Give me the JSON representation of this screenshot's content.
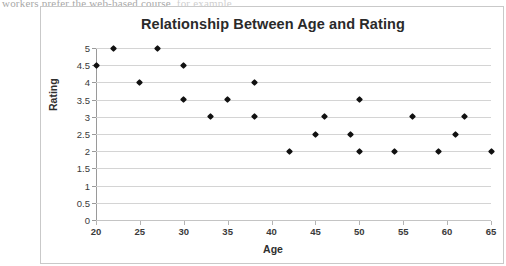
{
  "document": {
    "cutoff_text_visible": "workers prefer the web-based course,",
    "cutoff_text_faded": "for example,"
  },
  "chart_data": {
    "type": "scatter",
    "title": "Relationship Between Age and Rating",
    "xlabel": "Age",
    "ylabel": "Rating",
    "xlim": [
      20,
      65
    ],
    "ylim": [
      0,
      5
    ],
    "grid": true,
    "legend": false,
    "xticks": [
      20,
      25,
      30,
      35,
      40,
      45,
      50,
      55,
      60,
      65
    ],
    "xtick_labels": [
      "20",
      "25",
      "30",
      "35",
      "40",
      "45",
      "50",
      "55",
      "60",
      "65"
    ],
    "yticks": [
      0,
      0.5,
      1,
      1.5,
      2,
      2.5,
      3,
      3.5,
      4,
      4.5,
      5
    ],
    "ytick_labels": [
      "0",
      "0.5",
      "1",
      "1.5",
      "2",
      "2.5",
      "3",
      "3.5",
      "4",
      "4.5",
      "5"
    ],
    "marker": "diamond",
    "marker_color": "#111111",
    "points": [
      {
        "x": 20,
        "y": 4.5
      },
      {
        "x": 22,
        "y": 5
      },
      {
        "x": 25,
        "y": 4
      },
      {
        "x": 27,
        "y": 5
      },
      {
        "x": 30,
        "y": 4.5
      },
      {
        "x": 30,
        "y": 3.5
      },
      {
        "x": 33,
        "y": 3
      },
      {
        "x": 35,
        "y": 3.5
      },
      {
        "x": 38,
        "y": 4
      },
      {
        "x": 38,
        "y": 3
      },
      {
        "x": 42,
        "y": 2
      },
      {
        "x": 45,
        "y": 2.5
      },
      {
        "x": 46,
        "y": 3
      },
      {
        "x": 49,
        "y": 2.5
      },
      {
        "x": 50,
        "y": 3.5
      },
      {
        "x": 50,
        "y": 2
      },
      {
        "x": 54,
        "y": 2
      },
      {
        "x": 56,
        "y": 3
      },
      {
        "x": 59,
        "y": 2
      },
      {
        "x": 61,
        "y": 2.5
      },
      {
        "x": 62,
        "y": 3
      },
      {
        "x": 65,
        "y": 2
      }
    ]
  }
}
